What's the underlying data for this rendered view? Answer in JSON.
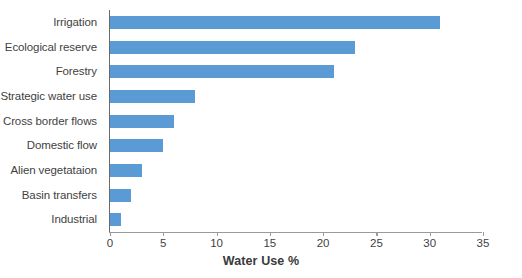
{
  "chart_data": {
    "type": "bar",
    "orientation": "horizontal",
    "title": "",
    "xlabel": "Water Use %",
    "ylabel": "",
    "xlim": [
      0,
      35
    ],
    "xticks": [
      0,
      5,
      10,
      15,
      20,
      25,
      30,
      35
    ],
    "grid": false,
    "legend": false,
    "bar_color": "#5B9BD5",
    "categories": [
      "Industrial",
      "Basin transfers",
      "Alien vegetataion",
      "Domestic flow",
      "Cross border flows",
      "Strategic water use",
      "Forestry",
      "Ecological reserve",
      "Irrigation"
    ],
    "values": [
      1,
      2,
      3,
      5,
      6,
      8,
      21,
      23,
      31
    ]
  },
  "axis": {
    "value_axis_title": "Water Use %",
    "tick_labels": [
      "0",
      "5",
      "10",
      "15",
      "20",
      "25",
      "30",
      "35"
    ]
  }
}
